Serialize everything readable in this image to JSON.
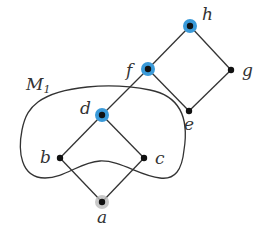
{
  "diagram": {
    "type": "hasse-diagram-with-region",
    "region": {
      "label": "M",
      "subscript": "1",
      "stroke": "#333333"
    },
    "nodes": [
      {
        "id": "a",
        "label": "a",
        "x": 102,
        "y": 202,
        "highlight": "gray"
      },
      {
        "id": "b",
        "label": "b",
        "x": 60,
        "y": 158,
        "highlight": "none"
      },
      {
        "id": "c",
        "label": "c",
        "x": 144,
        "y": 158,
        "highlight": "none"
      },
      {
        "id": "d",
        "label": "d",
        "x": 102,
        "y": 115,
        "highlight": "blue"
      },
      {
        "id": "e",
        "label": "e",
        "x": 189,
        "y": 111,
        "highlight": "none"
      },
      {
        "id": "f",
        "label": "f",
        "x": 148,
        "y": 69,
        "highlight": "blue"
      },
      {
        "id": "g",
        "label": "g",
        "x": 231,
        "y": 70,
        "highlight": "none"
      },
      {
        "id": "h",
        "label": "h",
        "x": 190,
        "y": 26,
        "highlight": "blue"
      }
    ],
    "edges": [
      [
        "a",
        "b"
      ],
      [
        "a",
        "c"
      ],
      [
        "b",
        "d"
      ],
      [
        "c",
        "d"
      ],
      [
        "d",
        "f"
      ],
      [
        "f",
        "h"
      ],
      [
        "f",
        "e"
      ],
      [
        "e",
        "g"
      ],
      [
        "g",
        "h"
      ]
    ],
    "colors": {
      "blue_highlight": "#3a9ad9",
      "gray_highlight": "#bbbbbb",
      "node": "#111111",
      "edge": "#333333"
    }
  }
}
